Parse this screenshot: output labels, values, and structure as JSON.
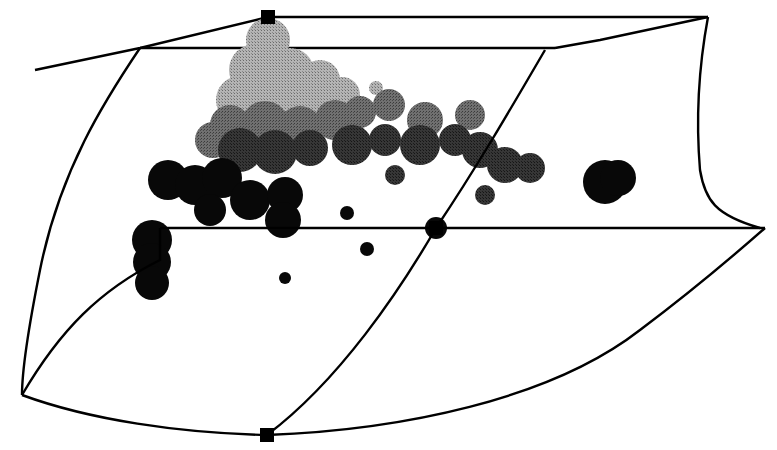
{
  "chart_data": {
    "type": "scatter",
    "subtype": "3d-scatter-in-wireframe-box",
    "title": "",
    "xlabel": "",
    "ylabel": "",
    "zlabel": "",
    "legend": [],
    "grid": false,
    "shading": "grayscale by depth (light gray at top/back, black at bottom/front)",
    "colors": {
      "background": "#ffffff",
      "wireframe": "#000000",
      "point_light": "#9a9a9a",
      "point_mid": "#5e5e5e",
      "point_dark": "#262626",
      "point_black": "#080808"
    },
    "wireframe": {
      "corner_markers": [
        {
          "x": 268,
          "y": 17
        },
        {
          "x": 436,
          "y": 228
        },
        {
          "x": 267,
          "y": 435
        }
      ],
      "edges": [
        "M35,70 L140,48 L268,17",
        "M268,17 L708,17",
        "M140,48 L555,48",
        "M555,48 L600,40 L708,17",
        "M708,17 C700,60 695,110 700,170 C705,200 715,215 760,228",
        "M140,48 C105,100 60,170 40,270 C28,330 22,370 22,395",
        "M160,228 L765,228",
        "M22,395 C60,330 100,290 160,260 L160,228",
        "M22,395 C90,420 180,433 267,435",
        "M267,435 C400,430 550,400 640,330 C700,285 740,250 765,228",
        "M545,50 C510,110 475,170 436,228 C400,290 340,380 267,435"
      ]
    },
    "points": [
      {
        "x": 268,
        "y": 40,
        "r": 22,
        "shade": "light"
      },
      {
        "x": 255,
        "y": 70,
        "r": 26,
        "shade": "light"
      },
      {
        "x": 290,
        "y": 72,
        "r": 24,
        "shade": "light"
      },
      {
        "x": 320,
        "y": 80,
        "r": 20,
        "shade": "light"
      },
      {
        "x": 240,
        "y": 100,
        "r": 24,
        "shade": "light"
      },
      {
        "x": 275,
        "y": 100,
        "r": 26,
        "shade": "light"
      },
      {
        "x": 310,
        "y": 105,
        "r": 22,
        "shade": "light"
      },
      {
        "x": 342,
        "y": 95,
        "r": 18,
        "shade": "light"
      },
      {
        "x": 376,
        "y": 88,
        "r": 7,
        "shade": "light"
      },
      {
        "x": 230,
        "y": 125,
        "r": 20,
        "shade": "mid"
      },
      {
        "x": 265,
        "y": 125,
        "r": 24,
        "shade": "mid"
      },
      {
        "x": 300,
        "y": 128,
        "r": 22,
        "shade": "mid"
      },
      {
        "x": 335,
        "y": 120,
        "r": 20,
        "shade": "mid"
      },
      {
        "x": 360,
        "y": 112,
        "r": 16,
        "shade": "mid"
      },
      {
        "x": 389,
        "y": 105,
        "r": 16,
        "shade": "mid"
      },
      {
        "x": 425,
        "y": 120,
        "r": 18,
        "shade": "mid"
      },
      {
        "x": 470,
        "y": 115,
        "r": 15,
        "shade": "mid"
      },
      {
        "x": 213,
        "y": 140,
        "r": 18,
        "shade": "mid"
      },
      {
        "x": 240,
        "y": 150,
        "r": 22,
        "shade": "dark"
      },
      {
        "x": 275,
        "y": 152,
        "r": 22,
        "shade": "dark"
      },
      {
        "x": 310,
        "y": 148,
        "r": 18,
        "shade": "dark"
      },
      {
        "x": 352,
        "y": 145,
        "r": 20,
        "shade": "dark"
      },
      {
        "x": 385,
        "y": 140,
        "r": 16,
        "shade": "dark"
      },
      {
        "x": 420,
        "y": 145,
        "r": 20,
        "shade": "dark"
      },
      {
        "x": 455,
        "y": 140,
        "r": 16,
        "shade": "dark"
      },
      {
        "x": 480,
        "y": 150,
        "r": 18,
        "shade": "dark"
      },
      {
        "x": 505,
        "y": 165,
        "r": 18,
        "shade": "dark"
      },
      {
        "x": 530,
        "y": 168,
        "r": 15,
        "shade": "dark"
      },
      {
        "x": 395,
        "y": 175,
        "r": 10,
        "shade": "dark"
      },
      {
        "x": 485,
        "y": 195,
        "r": 10,
        "shade": "dark"
      },
      {
        "x": 168,
        "y": 180,
        "r": 20,
        "shade": "black"
      },
      {
        "x": 195,
        "y": 185,
        "r": 20,
        "shade": "black"
      },
      {
        "x": 222,
        "y": 178,
        "r": 20,
        "shade": "black"
      },
      {
        "x": 210,
        "y": 210,
        "r": 16,
        "shade": "black"
      },
      {
        "x": 250,
        "y": 200,
        "r": 20,
        "shade": "black"
      },
      {
        "x": 285,
        "y": 195,
        "r": 18,
        "shade": "black"
      },
      {
        "x": 283,
        "y": 220,
        "r": 18,
        "shade": "black"
      },
      {
        "x": 605,
        "y": 182,
        "r": 22,
        "shade": "black"
      },
      {
        "x": 618,
        "y": 178,
        "r": 18,
        "shade": "black"
      },
      {
        "x": 152,
        "y": 240,
        "r": 20,
        "shade": "black"
      },
      {
        "x": 152,
        "y": 262,
        "r": 19,
        "shade": "black"
      },
      {
        "x": 152,
        "y": 283,
        "r": 17,
        "shade": "black"
      },
      {
        "x": 347,
        "y": 213,
        "r": 7,
        "shade": "black"
      },
      {
        "x": 367,
        "y": 249,
        "r": 7,
        "shade": "black"
      },
      {
        "x": 436,
        "y": 228,
        "r": 11,
        "shade": "black"
      },
      {
        "x": 285,
        "y": 278,
        "r": 6,
        "shade": "black"
      }
    ]
  }
}
